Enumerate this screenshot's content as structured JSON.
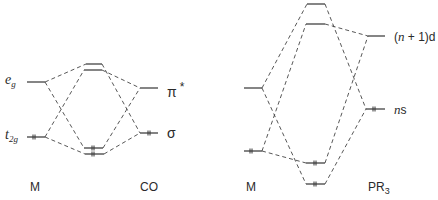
{
  "diagrams": [
    {
      "name": "M-CO",
      "left_fragment": "M",
      "right_fragment": "CO",
      "metal_levels": [
        {
          "label_main": "e",
          "label_sub": "g",
          "y": 82,
          "electrons": 0
        },
        {
          "label_main": "t",
          "label_sub": "2g",
          "y": 137,
          "electrons": 2
        }
      ],
      "ligand_levels": [
        {
          "label": "π",
          "label_sup": "*",
          "y": 88,
          "electrons": 0
        },
        {
          "label": "σ",
          "y": 133,
          "electrons": 2
        }
      ],
      "mo_levels": [
        {
          "y": 64,
          "electrons": 0
        },
        {
          "y": 70,
          "electrons": 0
        },
        {
          "y": 148,
          "electrons": 2
        },
        {
          "y": 154,
          "electrons": 2
        }
      ]
    },
    {
      "name": "M-PR3",
      "left_fragment": "M",
      "right_fragment": "PR",
      "right_fragment_sub": "3",
      "metal_levels": [
        {
          "y": 88,
          "electrons": 0
        },
        {
          "y": 151,
          "electrons": 2
        }
      ],
      "ligand_levels": [
        {
          "label": "(n + 1)d",
          "y": 36,
          "electrons": 0
        },
        {
          "label": "ns",
          "y": 109,
          "electrons": 2
        }
      ],
      "mo_levels": [
        {
          "y": 4,
          "electrons": 0
        },
        {
          "y": 24,
          "electrons": 0
        },
        {
          "y": 163,
          "electrons": 2
        },
        {
          "y": 184,
          "electrons": 2
        }
      ]
    }
  ],
  "labels": {
    "eg_main": "e",
    "eg_sub": "g",
    "t2g_main": "t",
    "t2g_sub": "2g",
    "pi_star": "π",
    "pi_star_sup": "*",
    "sigma": "σ",
    "m1": "M",
    "co": "CO",
    "m2": "M",
    "pr": "PR",
    "pr_sub": "3",
    "n1d_open": "(",
    "n1d_n": "n",
    "n1d_rest": " + 1)d",
    "ns_n": "n",
    "ns_s": "s"
  }
}
